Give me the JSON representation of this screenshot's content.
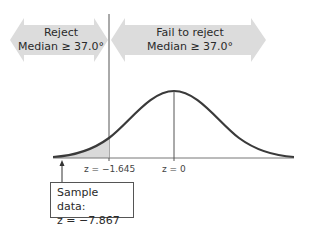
{
  "regions": {
    "reject": {
      "line1": "Reject",
      "line2": "Median ≥ 37.0°"
    },
    "fail_to_reject": {
      "line1": "Fail to reject",
      "line2": "Median ≥ 37.0°"
    }
  },
  "axis": {
    "critical_label": "z = −1.645",
    "center_label": "z = 0"
  },
  "sample_box": {
    "line1": "Sample data:",
    "line2": "z = −7.867"
  },
  "colors": {
    "arrow_fill": "#dcdcdc",
    "curve": "#3a3a3a",
    "shaded_region": "#d9d9d9",
    "axis": "#666666"
  }
}
